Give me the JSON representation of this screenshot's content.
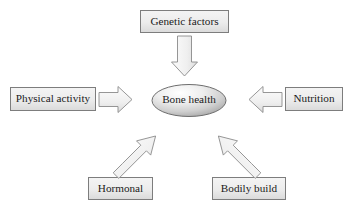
{
  "diagram": {
    "center": {
      "id": "bone-health",
      "label": "Bone health",
      "shape": "ellipse"
    },
    "factors": [
      {
        "id": "genetic-factors",
        "label": "Genetic factors",
        "position": "top",
        "arrow_direction": "down"
      },
      {
        "id": "physical-activity",
        "label": "Physical activity",
        "position": "left",
        "arrow_direction": "right"
      },
      {
        "id": "nutrition",
        "label": "Nutrition",
        "position": "right",
        "arrow_direction": "left"
      },
      {
        "id": "hormonal",
        "label": "Hormonal",
        "position": "bottom-left",
        "arrow_direction": "up-right"
      },
      {
        "id": "bodily-build",
        "label": "Bodily build",
        "position": "bottom-right",
        "arrow_direction": "up-left"
      }
    ],
    "colors": {
      "background": "#ffffff",
      "box_fill_light": "#f2f2f2",
      "box_fill_dark": "#dcdcdc",
      "box_stroke": "#808080",
      "arrow_fill_light": "#fbfbfb",
      "arrow_fill_dark": "#e2e2e2",
      "arrow_stroke": "#8a8a8a",
      "ellipse_fill_light": "#fdfdfd",
      "ellipse_fill_dark": "#b8b8b8",
      "ellipse_stroke": "#6e6e6e",
      "text": "#1a1a1a"
    }
  }
}
